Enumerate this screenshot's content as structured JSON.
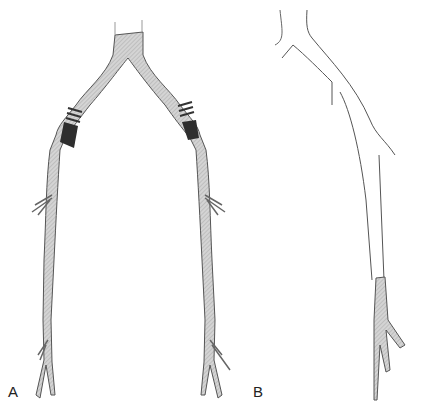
{
  "figure": {
    "panels": [
      {
        "label": "A",
        "description": "Bilateral iliac-femoral vessel tree, fully shaded, with striped/dark graft segments at both proximal limbs"
      },
      {
        "label": "B",
        "description": "Single vessel drawn in outline, shaded only in the distal segment"
      }
    ]
  },
  "colors": {
    "vessel_fill": "#c9c9c9",
    "outline": "#555555",
    "graft_dark": "#2e2e2e"
  }
}
